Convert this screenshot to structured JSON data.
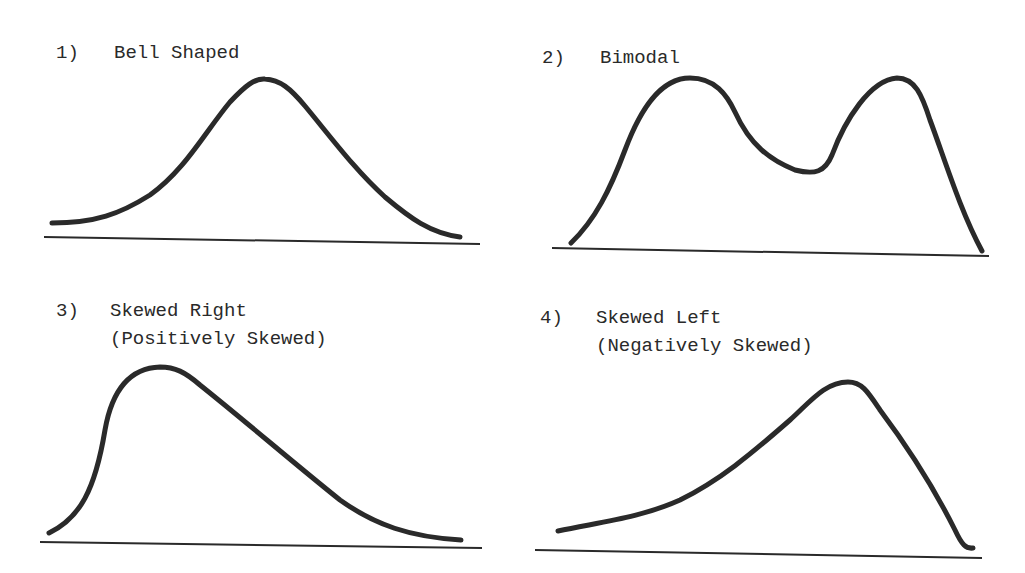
{
  "colors": {
    "ink": "#2a2a2a",
    "background": "#ffffff"
  },
  "panels": [
    {
      "number": "1)",
      "title": "Bell Shaped",
      "subtitle": "",
      "shape": "bell-shaped"
    },
    {
      "number": "2)",
      "title": "Bimodal",
      "subtitle": "",
      "shape": "bimodal"
    },
    {
      "number": "3)",
      "title": "Skewed Right",
      "subtitle": "(Positively Skewed)",
      "shape": "skewed-right"
    },
    {
      "number": "4)",
      "title": "Skewed Left",
      "subtitle": "(Negatively Skewed)",
      "shape": "skewed-left"
    }
  ]
}
